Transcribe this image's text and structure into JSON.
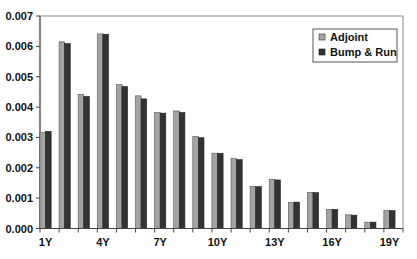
{
  "chart_data": {
    "type": "bar",
    "title": "",
    "xlabel": "",
    "ylabel": "",
    "ylim": [
      0,
      0.007
    ],
    "yticks": [
      "0.000",
      "0.001",
      "0.002",
      "0.003",
      "0.004",
      "0.005",
      "0.006",
      "0.007"
    ],
    "grid": false,
    "legend_position": "top-right",
    "categories": [
      "1Y",
      "2Y",
      "3Y",
      "4Y",
      "5Y",
      "6Y",
      "7Y",
      "8Y",
      "9Y",
      "10Y",
      "11Y",
      "12Y",
      "13Y",
      "14Y",
      "15Y",
      "16Y",
      "17Y",
      "18Y",
      "19Y"
    ],
    "xtick_labels": [
      "1Y",
      "4Y",
      "7Y",
      "10Y",
      "13Y",
      "16Y",
      "19Y"
    ],
    "series": [
      {
        "name": "Adjoint",
        "color": "#a3a3a3",
        "values": [
          0.00316,
          0.00615,
          0.00442,
          0.00641,
          0.00474,
          0.00437,
          0.00382,
          0.00387,
          0.00303,
          0.00248,
          0.0023,
          0.00139,
          0.00162,
          0.00086,
          0.00119,
          0.00063,
          0.00045,
          0.00021,
          0.00059
        ]
      },
      {
        "name": "Bump & Run",
        "color": "#333333",
        "values": [
          0.0032,
          0.00609,
          0.00435,
          0.0064,
          0.00468,
          0.00427,
          0.0038,
          0.00382,
          0.00299,
          0.00248,
          0.00227,
          0.00138,
          0.0016,
          0.00087,
          0.00118,
          0.00063,
          0.00044,
          0.00021,
          0.00059
        ]
      }
    ]
  },
  "legend": {
    "items": [
      {
        "label": "Adjoint"
      },
      {
        "label": "Bump & Run"
      }
    ]
  }
}
